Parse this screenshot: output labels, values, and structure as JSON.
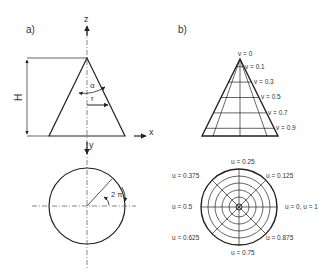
{
  "panel_a": {
    "label": "a)",
    "height_label": "H",
    "angle_label": "α",
    "radius_label": "r",
    "axis_z": "z",
    "axis_x": "x",
    "axis_y": "y",
    "rotation_label": "2 π"
  },
  "panel_b": {
    "label": "b)",
    "v_labels": [
      "v = 0",
      "v = 0.1",
      "v = 0.3",
      "v = 0.5",
      "v = 0.7",
      "v = 0.9"
    ],
    "u_labels": {
      "u_025": "u = 0.25",
      "u_0375": "u = 0.375",
      "u_0125": "u = 0.125",
      "u_05": "u = 0.5",
      "u_0_1": "u = 0, u = 1",
      "u_0625": "u = 0.625",
      "u_0875": "u = 0.875",
      "u_075": "u = 0.75"
    }
  },
  "colors": {
    "line": "#222222",
    "text": "#333333"
  }
}
